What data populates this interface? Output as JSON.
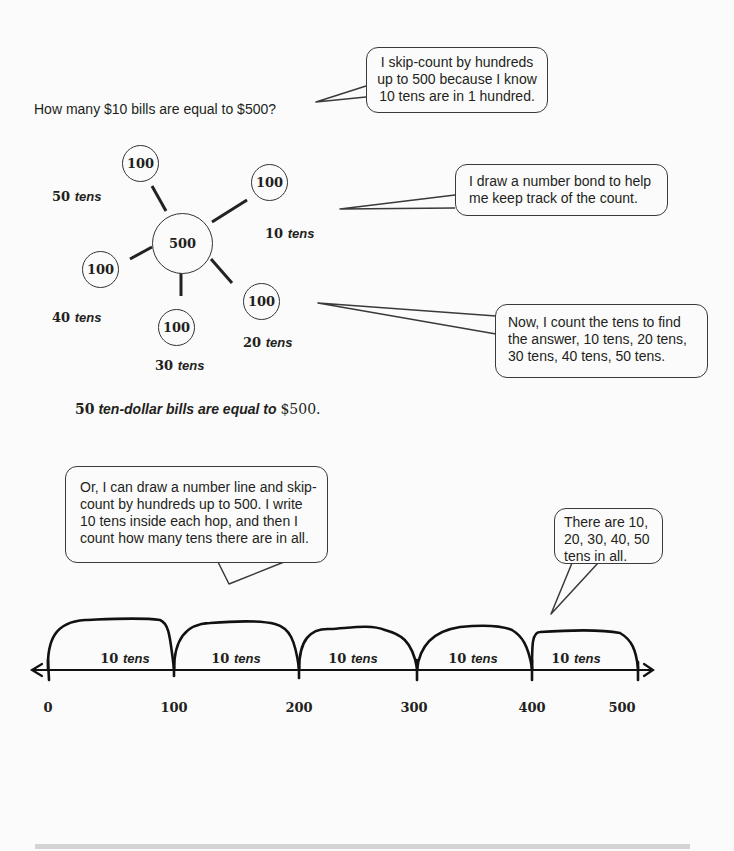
{
  "question": "How many $10 bills are equal to $500?",
  "bubbles": {
    "skip_count": "I skip-count by hundreds up to 500 because I know 10 tens are in 1 hundred.",
    "number_bond": "I draw a number bond to help me keep track of the count.",
    "count_tens": "Now, I count the tens to find the answer, 10 tens, 20 tens, 30 tens, 40 tens, 50 tens.",
    "number_line": "Or, I can draw a number line and skip-count by hundreds up to 500.  I write 10 tens inside each hop, and then I count how many tens there are in all.",
    "in_all": "There are 10, 20, 30, 40, 50 tens in all."
  },
  "number_bond": {
    "whole": "500",
    "parts": [
      "100",
      "100",
      "100",
      "100",
      "100"
    ],
    "labels": [
      {
        "num": "10",
        "unit": "tens"
      },
      {
        "num": "20",
        "unit": "tens"
      },
      {
        "num": "30",
        "unit": "tens"
      },
      {
        "num": "40",
        "unit": "tens"
      },
      {
        "num": "50",
        "unit": "tens"
      }
    ]
  },
  "answer": {
    "num": "50",
    "text": "ten-dollar bills are equal to",
    "amount": "$500."
  },
  "number_line": {
    "ticks": [
      "0",
      "100",
      "200",
      "300",
      "400",
      "500"
    ],
    "hops": [
      {
        "num": "10",
        "unit": "tens"
      },
      {
        "num": "10",
        "unit": "tens"
      },
      {
        "num": "10",
        "unit": "tens"
      },
      {
        "num": "10",
        "unit": "tens"
      },
      {
        "num": "10",
        "unit": "tens"
      }
    ]
  }
}
